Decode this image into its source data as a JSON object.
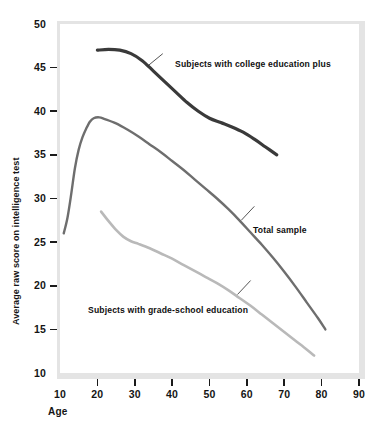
{
  "figure": {
    "background_color": "#ffffff",
    "frame_color": "#e4e4e4",
    "plot_background": "#ffffff"
  },
  "axes": {
    "y_title": "Average raw score on intelligence test",
    "x_title": "Age",
    "y_ticks": [
      "10",
      "15",
      "20",
      "25",
      "30",
      "35",
      "40",
      "45",
      "50"
    ],
    "x_ticks": [
      "10",
      "20",
      "30",
      "40",
      "50",
      "60",
      "70",
      "80",
      "90"
    ]
  },
  "series_labels": {
    "college": "Subjects with college education plus",
    "total": "Total sample",
    "grade": "Subjects with grade-school education"
  },
  "chart_data": {
    "type": "line",
    "title": "",
    "subtitle": "",
    "xlabel": "Age",
    "ylabel": "Average raw score on intelligence test",
    "xlim": [
      10,
      90
    ],
    "ylim": [
      10,
      50
    ],
    "x_ticks": [
      10,
      20,
      30,
      40,
      50,
      60,
      70,
      80,
      90
    ],
    "y_ticks": [
      10,
      15,
      20,
      25,
      30,
      35,
      40,
      45,
      50
    ],
    "grid": false,
    "legend": "inline-annotations",
    "series": [
      {
        "name": "Subjects with college education plus",
        "color": "#3a3a3a",
        "line_width": 3.2,
        "points": [
          [
            20.0,
            47.0
          ],
          [
            23.0,
            47.1
          ],
          [
            26.0,
            47.0
          ],
          [
            29.0,
            46.6
          ],
          [
            32.0,
            45.8
          ],
          [
            35.0,
            44.6
          ],
          [
            38.0,
            43.4
          ],
          [
            41.0,
            42.2
          ],
          [
            44.0,
            41.0
          ],
          [
            47.0,
            40.0
          ],
          [
            50.0,
            39.2
          ],
          [
            53.0,
            38.7
          ],
          [
            56.0,
            38.2
          ],
          [
            59.0,
            37.6
          ],
          [
            62.0,
            36.8
          ],
          [
            65.0,
            35.9
          ],
          [
            68.0,
            35.0
          ]
        ]
      },
      {
        "name": "Total sample",
        "color": "#6e6e6e",
        "line_width": 2.4,
        "points": [
          [
            11.0,
            26.0
          ],
          [
            12.0,
            27.8
          ],
          [
            13.0,
            30.5
          ],
          [
            14.0,
            33.5
          ],
          [
            15.0,
            35.6
          ],
          [
            16.0,
            37.0
          ],
          [
            17.0,
            38.0
          ],
          [
            18.0,
            38.8
          ],
          [
            19.0,
            39.2
          ],
          [
            20.5,
            39.3
          ],
          [
            22.0,
            39.1
          ],
          [
            25.0,
            38.6
          ],
          [
            28.0,
            37.9
          ],
          [
            31.0,
            37.1
          ],
          [
            34.0,
            36.2
          ],
          [
            37.0,
            35.3
          ],
          [
            40.0,
            34.3
          ],
          [
            43.0,
            33.3
          ],
          [
            46.0,
            32.2
          ],
          [
            49.0,
            31.1
          ],
          [
            52.0,
            30.0
          ],
          [
            55.0,
            28.8
          ],
          [
            58.0,
            27.5
          ],
          [
            61.0,
            26.1
          ],
          [
            64.0,
            24.7
          ],
          [
            67.0,
            23.2
          ],
          [
            70.0,
            21.6
          ],
          [
            73.0,
            19.9
          ],
          [
            76.0,
            18.1
          ],
          [
            79.0,
            16.3
          ],
          [
            81.0,
            15.0
          ]
        ]
      },
      {
        "name": "Subjects with grade-school education",
        "color": "#b9b9b9",
        "line_width": 2.6,
        "points": [
          [
            21.0,
            28.5
          ],
          [
            23.0,
            27.4
          ],
          [
            25.0,
            26.4
          ],
          [
            27.0,
            25.6
          ],
          [
            29.0,
            25.1
          ],
          [
            31.0,
            24.8
          ],
          [
            34.0,
            24.3
          ],
          [
            37.0,
            23.7
          ],
          [
            40.0,
            23.1
          ],
          [
            43.0,
            22.4
          ],
          [
            46.0,
            21.7
          ],
          [
            49.0,
            21.0
          ],
          [
            52.0,
            20.3
          ],
          [
            55.0,
            19.5
          ],
          [
            58.0,
            18.6
          ],
          [
            61.0,
            17.7
          ],
          [
            64.0,
            16.7
          ],
          [
            67.0,
            15.7
          ],
          [
            70.0,
            14.7
          ],
          [
            73.0,
            13.7
          ],
          [
            76.0,
            12.7
          ],
          [
            78.0,
            12.0
          ]
        ]
      }
    ],
    "annotations": [
      {
        "text": "Subjects with college education plus",
        "leader_from": [
          33.5,
          45.2
        ],
        "leader_to": [
          37.5,
          46.6
        ]
      },
      {
        "text": "Total sample",
        "leader_from": [
          58.5,
          27.5
        ],
        "leader_to": [
          62.0,
          29.1
        ]
      },
      {
        "text": "Subjects with grade-school education",
        "leader_from": [
          57.5,
          19.0
        ],
        "leader_to": [
          61.0,
          20.6
        ]
      }
    ]
  }
}
